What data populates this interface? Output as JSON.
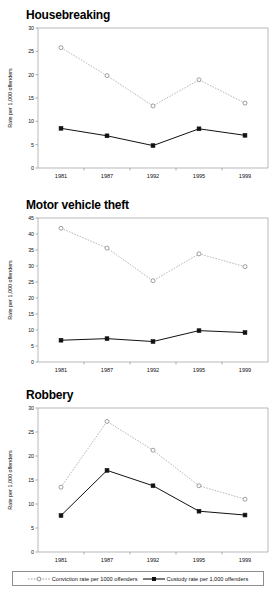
{
  "legend": {
    "conviction_label": "Conviction rate per 1000 offenders",
    "custody_label": "Custody rate per 1,000 offenders",
    "conviction_symbol": "dotted-line-open-circle-marker",
    "custody_symbol": "solid-line-filled-square-marker"
  },
  "colors": {
    "conviction_line": "#999999",
    "custody_line": "#111111",
    "axis": "#9a9a9a",
    "text": "#111111",
    "background": "#ffffff"
  },
  "chart_data": [
    {
      "type": "line",
      "title": "Housebreaking",
      "xlabel": "",
      "ylabel": "Rate per 1,000 offenders",
      "categories": [
        "1981",
        "1987",
        "1992",
        "1995",
        "1999"
      ],
      "ylim": [
        0,
        30
      ],
      "yticks": [
        0,
        5,
        10,
        15,
        20,
        25,
        30
      ],
      "grid": false,
      "legend_position": "bottom-shared",
      "series": [
        {
          "name": "Conviction rate per 1000 offenders",
          "values": [
            25.8,
            19.8,
            13.3,
            18.9,
            13.9
          ]
        },
        {
          "name": "Custody rate per 1,000 offenders",
          "values": [
            8.5,
            6.9,
            4.8,
            8.4,
            7.0
          ]
        }
      ]
    },
    {
      "type": "line",
      "title": "Motor vehicle theft",
      "xlabel": "",
      "ylabel": "Rate per 1,000 offenders",
      "categories": [
        "1981",
        "1987",
        "1992",
        "1995",
        "1999"
      ],
      "ylim": [
        0,
        45
      ],
      "yticks": [
        0,
        5,
        10,
        15,
        20,
        25,
        30,
        35,
        40,
        45
      ],
      "grid": false,
      "legend_position": "bottom-shared",
      "series": [
        {
          "name": "Conviction rate per 1000 offenders",
          "values": [
            41.8,
            35.6,
            25.4,
            33.8,
            29.8
          ]
        },
        {
          "name": "Custody rate per 1,000 offenders",
          "values": [
            6.8,
            7.3,
            6.4,
            9.8,
            9.2
          ]
        }
      ]
    },
    {
      "type": "line",
      "title": "Robbery",
      "xlabel": "",
      "ylabel": "Rate per 1,000 offenders",
      "categories": [
        "1981",
        "1987",
        "1992",
        "1995",
        "1999"
      ],
      "ylim": [
        0,
        30
      ],
      "yticks": [
        0,
        5,
        10,
        15,
        20,
        25,
        30
      ],
      "grid": false,
      "legend_position": "bottom-shared",
      "series": [
        {
          "name": "Conviction rate per 1000 offenders",
          "values": [
            13.5,
            27.2,
            21.2,
            13.8,
            11.0
          ]
        },
        {
          "name": "Custody rate per 1,000 offenders",
          "values": [
            7.6,
            17.0,
            13.8,
            8.5,
            7.7
          ]
        }
      ]
    }
  ]
}
